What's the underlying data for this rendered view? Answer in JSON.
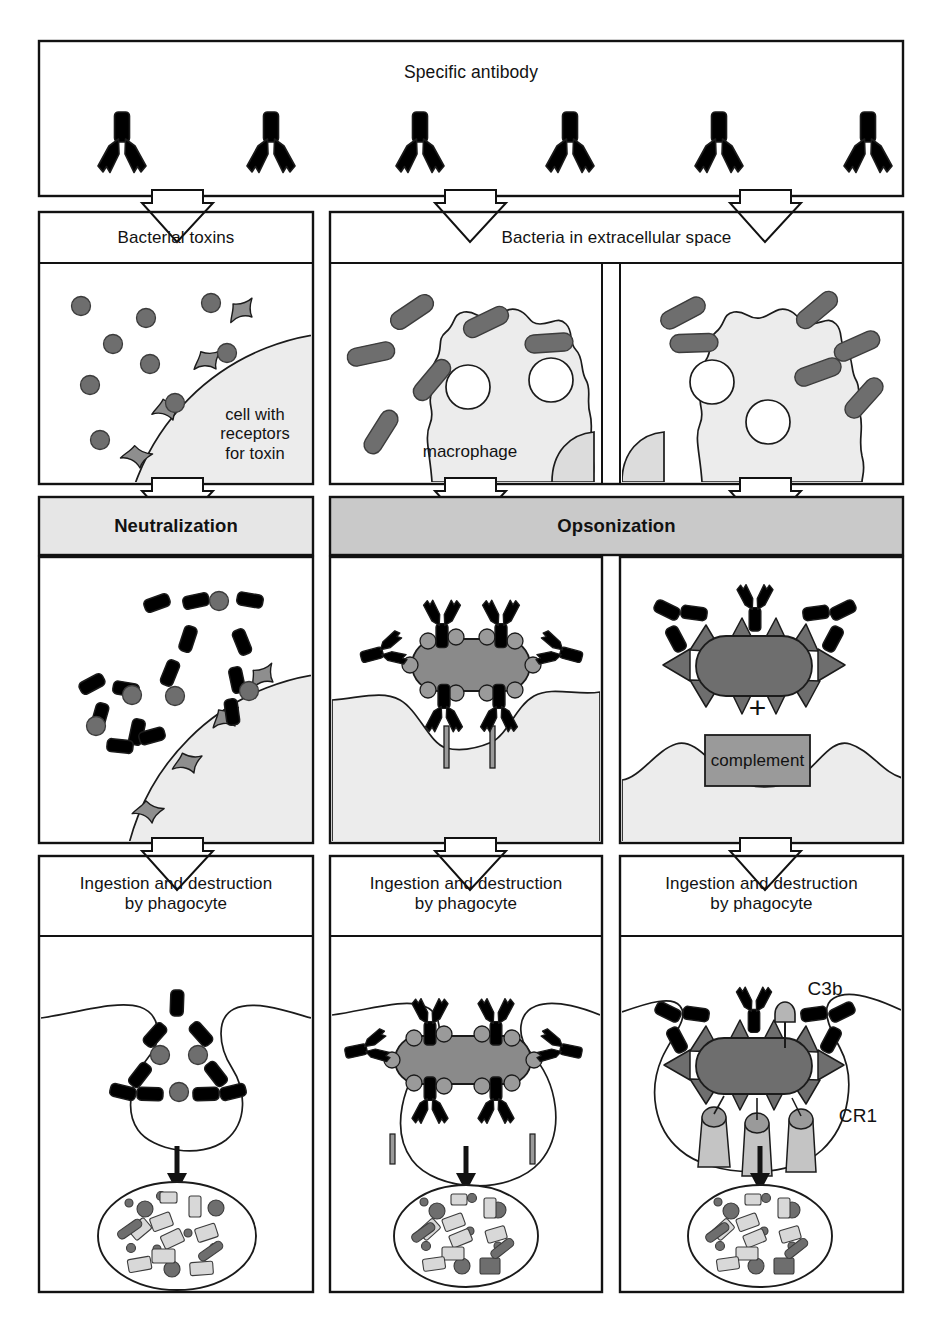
{
  "figure": {
    "top_panel": {
      "label": "Specific antibody"
    },
    "row2_headers": {
      "left": "Bacterial toxins",
      "right": "Bacteria in extracellular space"
    },
    "row2_inline_labels": {
      "cell_receptor": "cell with\nreceptors\nfor toxin",
      "macrophage": "macrophage"
    },
    "banners": {
      "left": "Neutralization",
      "right": "Opsonization"
    },
    "row3_inline_labels": {
      "plus": "+",
      "complement": "complement"
    },
    "row4_headers": [
      "Ingestion and destruction\nby phagocyte",
      "Ingestion and destruction\nby phagocyte",
      "Ingestion and destruction\nby phagocyte"
    ],
    "row4_inline_labels": {
      "c3b": "C3b",
      "cr1": "CR1"
    },
    "colors": {
      "ink": "#121212",
      "page": "#ffffff",
      "antibody_light": "#d6d6d6",
      "antibody_dark": "#4a4a4a",
      "toxin_dot": "#6e6e6e",
      "bacterium": "#6e6e6e",
      "receptor_gray": "#8e8e8e",
      "cell_fill": "#ececec",
      "banner_light": "#e6e6e6",
      "banner_dark": "#c9c9c9",
      "complement_box": "#9a9a9a",
      "cr1_light": "#c4c4c4",
      "debris_light": "#d8d8d8"
    },
    "counts": {
      "antibodies_top_light": 2,
      "antibodies_top_dark": 2,
      "antibodies_top_dark_spiky": 2,
      "toxin_dots_free": 7,
      "toxin_dots_bound": 2,
      "receptor_spikes_row2": 4,
      "bacteria_left_macrophage_panel": 7,
      "bacteria_right_macrophage_panel": 7,
      "macrophage_nuclei_left": 2,
      "macrophage_nuclei_right": 2,
      "neutral_complex_toxins_top": 3,
      "neutral_complex_toxins_bottom": 2,
      "receptor_spikes_row3": 4,
      "cr1_receptors": 3
    }
  }
}
